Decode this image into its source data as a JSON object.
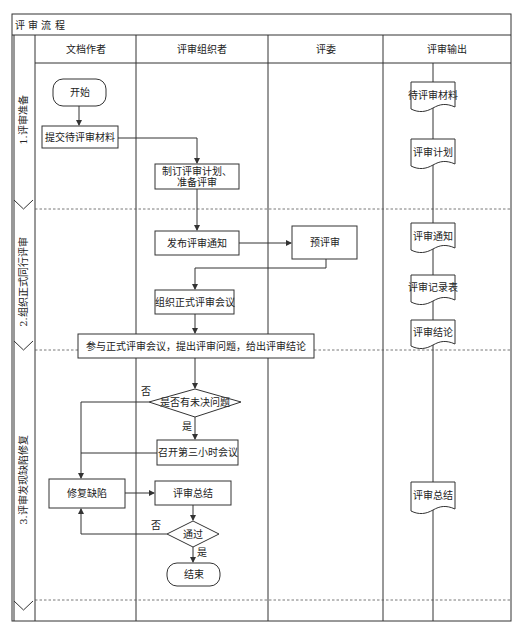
{
  "title": "评 审 流 程",
  "lanes": [
    {
      "label": "文档作者"
    },
    {
      "label": "评审组织者"
    },
    {
      "label": "评委"
    },
    {
      "label": "评审输出"
    }
  ],
  "phases": [
    {
      "label": "1.评审准备"
    },
    {
      "label": "2.组织正式同行评审"
    },
    {
      "label": "3.评审发现缺陷修复"
    }
  ],
  "nodes": {
    "start": "开始",
    "submit": "提交待评审材料",
    "plan_line1": "制订评审计划、",
    "plan_line2": "准备评审",
    "notice": "发布评审通知",
    "prereview": "预评审",
    "organize": "组织正式评审会议",
    "attend": "参与正式评审会议，提出评审问题，给出评审结论",
    "unresolved": "是否有未决问题",
    "third_hour": "召开第三小时会议",
    "fix": "修复缺陷",
    "summary": "评审总结",
    "pass": "通过",
    "end": "结束"
  },
  "edge_labels": {
    "unresolved_no": "否",
    "unresolved_yes": "是",
    "pass_no": "否",
    "pass_yes": "是"
  },
  "outputs": [
    {
      "label": "待评审材料"
    },
    {
      "label": "评审计划"
    },
    {
      "label": "评审通知"
    },
    {
      "label": "评审记录表"
    },
    {
      "label": "评审结论"
    },
    {
      "label": "评审总结"
    }
  ],
  "colors": {
    "stroke": "#333333",
    "background": "#ffffff",
    "text": "#222222"
  }
}
